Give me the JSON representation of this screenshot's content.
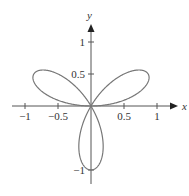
{
  "chart_data": {
    "type": "line",
    "title": "",
    "equation": "r = sin(3θ)",
    "xlabel": "x",
    "ylabel": "y",
    "xlim": [
      -1.1,
      1.2
    ],
    "ylim": [
      -1.1,
      1.3
    ],
    "x_ticks": [
      -1,
      -0.5,
      0.5,
      1
    ],
    "x_tick_labels": [
      "−1",
      "−0.5",
      "0.5",
      "1"
    ],
    "y_ticks": [
      1,
      0.5,
      -1
    ],
    "y_tick_labels": [
      "1",
      "0.5",
      "−1"
    ],
    "grid": false,
    "legend": null,
    "petals": [
      {
        "direction_deg": 30,
        "tip": [
          0.866,
          0.5
        ]
      },
      {
        "direction_deg": 150,
        "tip": [
          -0.866,
          0.5
        ]
      },
      {
        "direction_deg": 270,
        "tip": [
          0,
          -1
        ]
      }
    ],
    "curve_color": "#777777",
    "axis_color": "#555555"
  }
}
